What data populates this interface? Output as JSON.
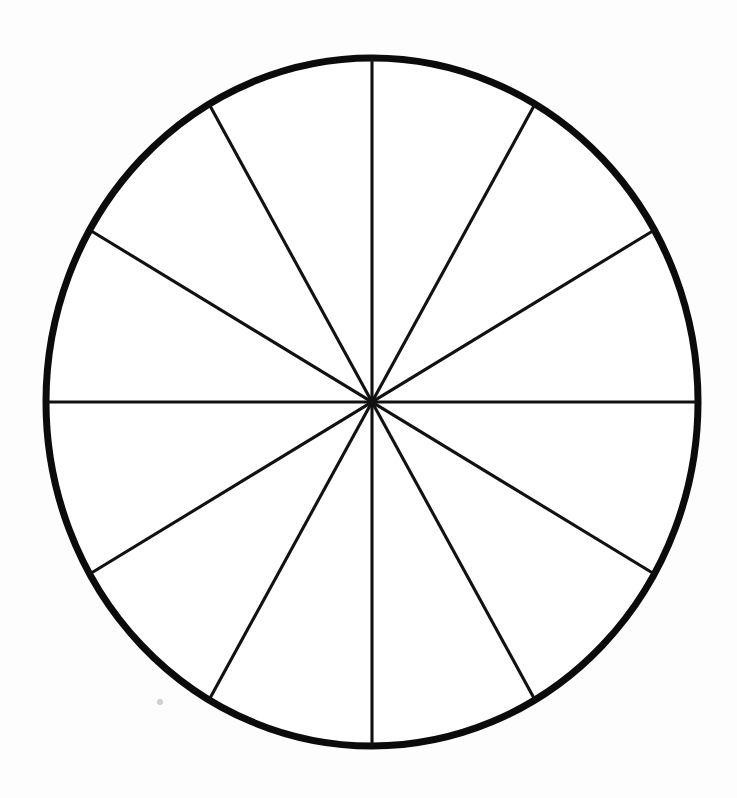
{
  "page": {
    "background_color": "#fdfdfd",
    "width": 737,
    "height": 798
  },
  "figure": {
    "name": "fraction-circle",
    "ink_color": "#0b0b0b",
    "fill_color": "#ffffff",
    "outline_stroke_width": 7,
    "divider_stroke_width": 3.1,
    "center_x": 372,
    "center_y": 402,
    "radius_x": 326,
    "radius_y": 344,
    "sector_count": 12,
    "sector_angle_degrees": 30,
    "fraction_label": "1/12",
    "artifact": {
      "name": "scan-speck",
      "x": 160,
      "y": 702,
      "radius": 3,
      "color": "#cfcfcf"
    }
  },
  "chart_data": {
    "type": "pie",
    "subtitle": "",
    "xlabel": "",
    "ylabel": "",
    "legend_position": "none",
    "grid": false,
    "labels_shown": false,
    "categories": [
      "1/12",
      "2/12",
      "3/12",
      "4/12",
      "5/12",
      "6/12",
      "7/12",
      "8/12",
      "9/12",
      "10/12",
      "11/12",
      "12/12"
    ],
    "values": [
      8.3333,
      8.3333,
      8.3333,
      8.3333,
      8.3333,
      8.3333,
      8.3333,
      8.3333,
      8.3333,
      8.3333,
      8.3333,
      8.3333
    ],
    "slice_angles_degrees": [
      30,
      30,
      30,
      30,
      30,
      30,
      30,
      30,
      30,
      30,
      30,
      30
    ],
    "divider_angles_degrees": [
      0,
      30,
      60,
      90,
      120,
      150,
      180,
      210,
      240,
      270,
      300,
      330
    ],
    "total": 100,
    "annotations": []
  }
}
